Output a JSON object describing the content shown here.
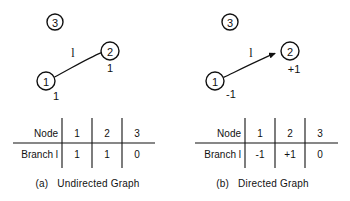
{
  "figure": {
    "panels": [
      {
        "id": "undirected",
        "caption_tag": "(a)",
        "caption_label": "Undirected Graph",
        "graph": {
          "type": "undirected",
          "nodes": [
            {
              "id": "3",
              "label": "3",
              "cx": 55,
              "cy": 22,
              "r": 8
            },
            {
              "id": "2",
              "label": "2",
              "cx": 110,
              "cy": 51,
              "r": 9
            },
            {
              "id": "1",
              "label": "1",
              "cx": 46,
              "cy": 81,
              "r": 9
            }
          ],
          "edges": [
            {
              "from": "1",
              "to": "2",
              "branch_label": "l",
              "directed": false,
              "endpoint_weights": [
                {
                  "node": "1",
                  "value": "1"
                },
                {
                  "node": "2",
                  "value": "1"
                }
              ]
            }
          ]
        },
        "table": {
          "row_headers": [
            "Node",
            "Branch l"
          ],
          "columns": [
            "1",
            "2",
            "3"
          ],
          "values": [
            "1",
            "1",
            "0"
          ]
        }
      },
      {
        "id": "directed",
        "caption_tag": "(b)",
        "caption_label": "Directed Graph",
        "graph": {
          "type": "directed",
          "nodes": [
            {
              "id": "3",
              "label": "3",
              "cx": 55,
              "cy": 22,
              "r": 8
            },
            {
              "id": "2",
              "label": "2",
              "cx": 115,
              "cy": 51,
              "r": 9
            },
            {
              "id": "1",
              "label": "1",
              "cx": 40,
              "cy": 81,
              "r": 9
            }
          ],
          "edges": [
            {
              "from": "1",
              "to": "2",
              "branch_label": "l",
              "directed": true,
              "endpoint_weights": [
                {
                  "node": "1",
                  "value": "-1"
                },
                {
                  "node": "2",
                  "value": "+1"
                }
              ]
            }
          ]
        },
        "table": {
          "row_headers": [
            "Node",
            "Branch l"
          ],
          "columns": [
            "1",
            "2",
            "3"
          ],
          "values": [
            "-1",
            "+1",
            "0"
          ]
        }
      }
    ]
  },
  "panel_a": {
    "node3": "3",
    "node2": "2",
    "node1": "1",
    "branch_label": "l",
    "weight_at_1": "1",
    "weight_at_2": "1",
    "table": {
      "header_row_label": "Node",
      "data_row_label": "Branch l",
      "col1": "1",
      "col2": "2",
      "col3": "3",
      "val1": "1",
      "val2": "1",
      "val3": "0"
    },
    "caption_tag": "(a)",
    "caption_label": "Undirected Graph"
  },
  "panel_b": {
    "node3": "3",
    "node2": "2",
    "node1": "1",
    "branch_label": "l",
    "weight_at_1": "-1",
    "weight_at_2": "+1",
    "table": {
      "header_row_label": "Node",
      "data_row_label": "Branch l",
      "col1": "1",
      "col2": "2",
      "col3": "3",
      "val1": "-1",
      "val2": "+1",
      "val3": "0"
    },
    "caption_tag": "(b)",
    "caption_label": "Directed Graph"
  },
  "colors": {
    "ink": "#111111",
    "background": "#ffffff"
  }
}
